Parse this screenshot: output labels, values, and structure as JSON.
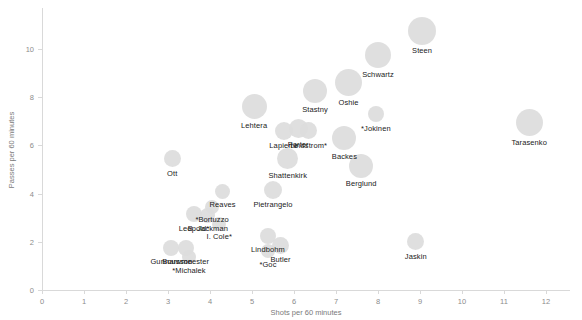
{
  "chart_data": {
    "type": "scatter",
    "title": "",
    "xlabel": "Shots per 60 minutes",
    "ylabel": "Passes per 60 minutes",
    "xlim": [
      0,
      12.6
    ],
    "ylim": [
      0,
      11.6
    ],
    "xticks": [
      0,
      1,
      2,
      3,
      4,
      5,
      6,
      7,
      8,
      9,
      10,
      11,
      12
    ],
    "yticks": [
      0,
      2,
      4,
      6,
      8,
      10
    ],
    "grid": false,
    "legend": "none",
    "bubble_color": "#dcdcdc",
    "axis_color": "#d9d9d9",
    "points": [
      {
        "label": "Steen",
        "x": 9.05,
        "y": 10.75,
        "size": 28
      },
      {
        "label": "Schwartz",
        "x": 8.0,
        "y": 9.75,
        "size": 26
      },
      {
        "label": "Oshie",
        "x": 7.3,
        "y": 8.6,
        "size": 27
      },
      {
        "label": "Stastny",
        "x": 6.5,
        "y": 8.25,
        "size": 24
      },
      {
        "label": "*Jokinen",
        "x": 7.95,
        "y": 7.3,
        "size": 16
      },
      {
        "label": "Lehtera",
        "x": 5.05,
        "y": 7.6,
        "size": 25
      },
      {
        "label": "Porter",
        "x": 6.1,
        "y": 6.7,
        "size": 19
      },
      {
        "label": "Lapierre",
        "x": 5.75,
        "y": 6.6,
        "size": 18
      },
      {
        "label": "Lindstrom*",
        "x": 6.35,
        "y": 6.6,
        "size": 17
      },
      {
        "label": "Tarasenko",
        "x": 11.6,
        "y": 6.95,
        "size": 27
      },
      {
        "label": "Backes",
        "x": 7.2,
        "y": 6.3,
        "size": 24
      },
      {
        "label": "Shattenkirk",
        "x": 5.85,
        "y": 5.45,
        "size": 21
      },
      {
        "label": "Berglund",
        "x": 7.6,
        "y": 5.15,
        "size": 24
      },
      {
        "label": "Ott",
        "x": 3.1,
        "y": 5.45,
        "size": 17
      },
      {
        "label": "Reaves",
        "x": 4.3,
        "y": 4.1,
        "size": 15
      },
      {
        "label": "Pietrangelo",
        "x": 5.5,
        "y": 4.15,
        "size": 18
      },
      {
        "label": "*Bortuzzo",
        "x": 4.05,
        "y": 3.45,
        "size": 14
      },
      {
        "label": "Leopold*",
        "x": 3.62,
        "y": 3.15,
        "size": 16
      },
      {
        "label": "B. Jackman",
        "x": 3.95,
        "y": 3.1,
        "size": 15
      },
      {
        "label": "I. Cole*",
        "x": 4.22,
        "y": 2.75,
        "size": 14
      },
      {
        "label": "Lindbohm",
        "x": 5.38,
        "y": 2.25,
        "size": 16
      },
      {
        "label": "Butler",
        "x": 5.68,
        "y": 1.85,
        "size": 17
      },
      {
        "label": "*Goc",
        "x": 5.38,
        "y": 1.6,
        "size": 14
      },
      {
        "label": "Jaskin",
        "x": 8.9,
        "y": 2.0,
        "size": 17
      },
      {
        "label": "Gunnarsson",
        "x": 3.08,
        "y": 1.75,
        "size": 16
      },
      {
        "label": "Bouwmeester",
        "x": 3.42,
        "y": 1.75,
        "size": 16
      },
      {
        "label": "*Michalek",
        "x": 3.5,
        "y": 1.35,
        "size": 14
      }
    ]
  },
  "axes": {
    "x_title": "Shots per 60 minutes",
    "y_title": "Passes per 60 minutes",
    "x_tick_labels": [
      "0",
      "1",
      "2",
      "3",
      "4",
      "5",
      "6",
      "7",
      "8",
      "9",
      "10",
      "11",
      "12"
    ],
    "y_tick_labels": [
      "0",
      "2",
      "4",
      "6",
      "8",
      "10"
    ]
  }
}
